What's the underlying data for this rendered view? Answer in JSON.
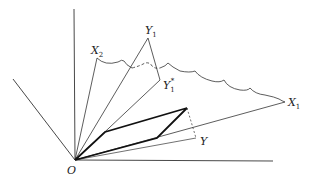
{
  "diagram": {
    "type": "vector-geometry",
    "labels": {
      "origin": "O",
      "x1": "X",
      "x1_sub": "1",
      "x2": "X",
      "x2_sub": "2",
      "y1": "Y",
      "y1_sub": "1",
      "y1star": "Y",
      "y1star_sub": "1",
      "y1star_sup": "*",
      "y": "Y"
    },
    "points": {
      "O": [
        75,
        160
      ],
      "X1": [
        285,
        102
      ],
      "X2": [
        97,
        58
      ],
      "Y1": [
        148,
        38
      ],
      "Y1star": [
        160,
        80
      ],
      "Y": [
        196,
        138
      ],
      "P1": [
        105,
        132
      ],
      "P2": [
        187,
        108
      ],
      "P3": [
        157,
        138
      ]
    },
    "colors": {
      "line": "#333333",
      "background": "#ffffff"
    }
  }
}
